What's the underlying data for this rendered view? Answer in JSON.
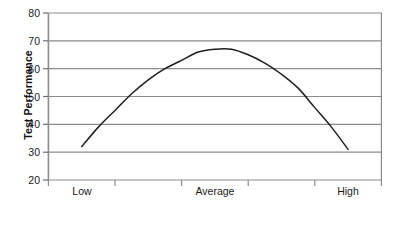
{
  "chart_data": {
    "type": "line",
    "title": "",
    "xlabel": "Anxiety",
    "ylabel": "Test Performance",
    "categories": [
      "Low",
      "Average",
      "High"
    ],
    "xtick_labels": [
      "Low",
      "Average",
      "High"
    ],
    "ytick_labels": [
      "20",
      "30",
      "40",
      "50",
      "60",
      "70",
      "80"
    ],
    "ylim": [
      20,
      80
    ],
    "ytick_step": 10,
    "grid": "horizontal",
    "legend": "none",
    "series": [
      {
        "name": "Test Performance vs Anxiety",
        "x": [
          0.1,
          0.15,
          0.2,
          0.25,
          0.3,
          0.35,
          0.4,
          0.45,
          0.5,
          0.55,
          0.6,
          0.65,
          0.7,
          0.75,
          0.8,
          0.85,
          0.9
        ],
        "values": [
          32,
          39,
          45,
          51,
          56,
          60,
          63,
          66,
          67,
          67,
          65,
          62,
          58,
          53,
          46,
          39,
          31
        ]
      }
    ],
    "annotations": {
      "peak_value": 67,
      "peak_x_label": "Average",
      "left_endpoint_value": 32,
      "right_endpoint_value": 31
    },
    "colors": {
      "curve": "#1f1f1f",
      "gridline": "#8c8c8c",
      "axis": "#8c8c8c",
      "text": "#1a1a1a",
      "background": "#ffffff"
    }
  }
}
